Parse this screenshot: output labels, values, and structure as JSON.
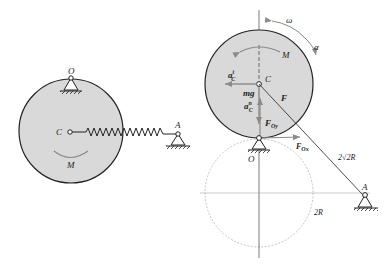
{
  "left_figure": {
    "labels": {
      "pivot": "O",
      "center": "C",
      "anchor": "A",
      "moment": "M"
    }
  },
  "right_figure": {
    "labels": {
      "center": "C",
      "pivot": "O",
      "anchor": "A",
      "moment": "M",
      "omega": "ω",
      "alpha": "α",
      "tangential_accel": "a",
      "tangential_sup": "t",
      "tangential_sub": "C",
      "normal_accel": "a",
      "normal_sup": "n",
      "normal_sub": "C",
      "weight": "mg",
      "force": "F",
      "reaction_y": "F",
      "reaction_y_sub": "Oy",
      "reaction_x": "F",
      "reaction_x_sub": "Ox",
      "spring_length": "2√2R",
      "radius_label": "2R"
    }
  },
  "colors": {
    "disk_fill": "#d9d9d9",
    "line": "#222222",
    "arrow_gray": "#8a8a8a",
    "dashed_circle": "#aaaaaa"
  }
}
